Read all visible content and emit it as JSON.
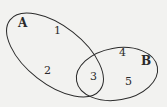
{
  "diagram": {
    "type": "venn",
    "colors": {
      "background": "#f2f2f0",
      "stroke": "#2a2a2a",
      "text": "#2a2a2a"
    },
    "sets": [
      {
        "name": "A",
        "elements_only": [
          "1",
          "2"
        ]
      },
      {
        "name": "B",
        "elements_only": [
          "4",
          "5"
        ]
      }
    ],
    "intersection": [
      "3"
    ],
    "labels": {
      "set_a": "A",
      "set_b": "B",
      "e1": "1",
      "e2": "2",
      "e3": "3",
      "e4": "4",
      "e5": "5"
    }
  }
}
